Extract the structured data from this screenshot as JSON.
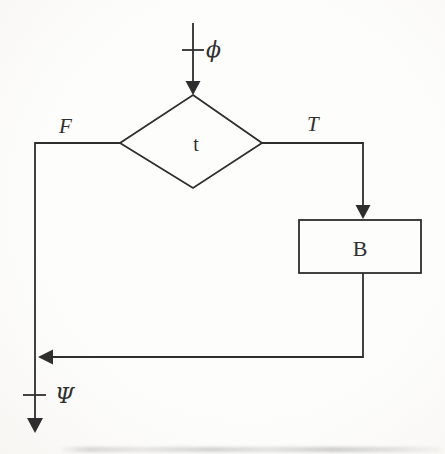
{
  "colors": {
    "line": "#2e2e2e",
    "background": "#fdfdfc"
  },
  "diagram": {
    "type": "flowchart-if-statement",
    "labels": {
      "entry_assertion": "ϕ",
      "decision": "t",
      "false_branch": "F",
      "true_branch": "T",
      "process": "B",
      "exit_assertion": "Ψ"
    }
  }
}
